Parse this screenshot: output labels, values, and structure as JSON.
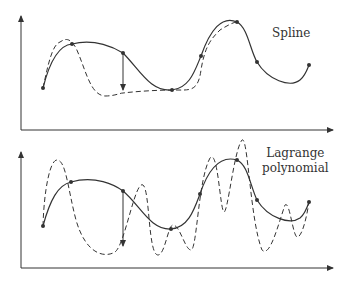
{
  "panels": [
    {
      "label_lines": [
        "Spline"
      ],
      "description": "Smooth spline through data points (solid) vs dashed comparison curve"
    },
    {
      "label_lines": [
        "Lagrange",
        "polynomial"
      ],
      "description": "Smooth curve through data points (solid) vs oscillating Lagrange polynomial (dashed)"
    }
  ],
  "colors": {
    "stroke": "#333333",
    "background": "#ffffff"
  }
}
